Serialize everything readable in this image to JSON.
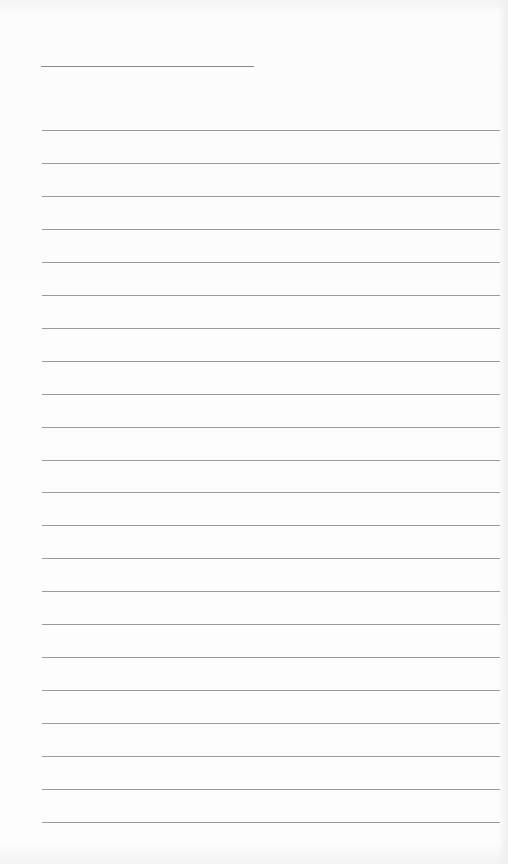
{
  "page": {
    "type": "blank lined paper",
    "title_line": {
      "text": ""
    },
    "rule_count": 22,
    "lines": [
      {
        "text": ""
      },
      {
        "text": ""
      },
      {
        "text": ""
      },
      {
        "text": ""
      },
      {
        "text": ""
      },
      {
        "text": ""
      },
      {
        "text": ""
      },
      {
        "text": ""
      },
      {
        "text": ""
      },
      {
        "text": ""
      },
      {
        "text": ""
      },
      {
        "text": ""
      },
      {
        "text": ""
      },
      {
        "text": ""
      },
      {
        "text": ""
      },
      {
        "text": ""
      },
      {
        "text": ""
      },
      {
        "text": ""
      },
      {
        "text": ""
      },
      {
        "text": ""
      },
      {
        "text": ""
      },
      {
        "text": ""
      }
    ],
    "colors": {
      "paper": "#fbfbfb",
      "rule": "#9a9a9a"
    }
  }
}
